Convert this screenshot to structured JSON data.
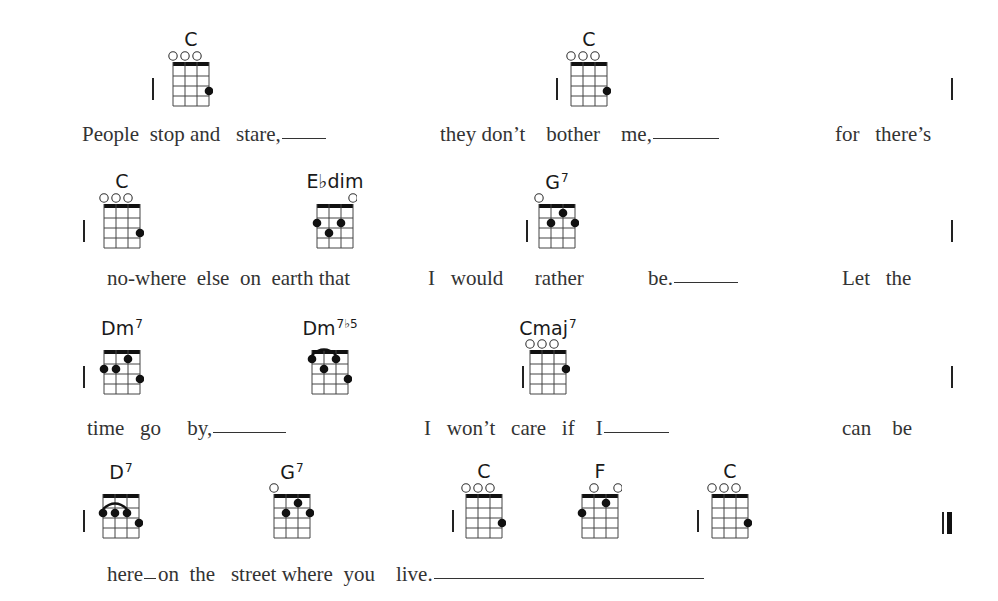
{
  "song": {
    "systems": [
      {
        "chords": [
          {
            "name": "C",
            "sup": "",
            "x": 191,
            "shape": "C"
          },
          {
            "name": "C",
            "sup": "",
            "x": 589,
            "shape": "C"
          }
        ],
        "barlines": [
          152,
          556,
          951
        ],
        "lyrics": [
          {
            "text": "People  stop and   stare,",
            "x": 82,
            "hold": 44
          },
          {
            "text": "they don’t    bother    me,",
            "x": 440,
            "hold": 66
          },
          {
            "text": "for   there’s",
            "x": 835,
            "hold": 0
          }
        ]
      },
      {
        "chords": [
          {
            "name": "C",
            "sup": "",
            "x": 122,
            "shape": "C"
          },
          {
            "name": "E♭dim",
            "sup": "",
            "x": 335,
            "shape": "Ebdim"
          },
          {
            "name": "G",
            "sup": "7",
            "x": 557,
            "shape": "G7"
          }
        ],
        "barlines": [
          83,
          526,
          951
        ],
        "lyrics": [
          {
            "text": "no-where  else  on  earth that",
            "x": 107,
            "hold": 0
          },
          {
            "text": "I   would      rather",
            "x": 428,
            "hold": 0
          },
          {
            "text": "be.",
            "x": 648,
            "hold": 64
          },
          {
            "text": "Let   the",
            "x": 842,
            "hold": 0
          }
        ]
      },
      {
        "chords": [
          {
            "name": "Dm",
            "sup": "7",
            "x": 122,
            "shape": "Dm7"
          },
          {
            "name": "Dm",
            "sup": "7♭5",
            "x": 330,
            "shape": "Dm7b5"
          },
          {
            "name": "Cmaj",
            "sup": "7",
            "x": 548,
            "shape": "Cmaj7"
          }
        ],
        "barlines": [
          83,
          522,
          951
        ],
        "lyrics": [
          {
            "text": "time   go     by,",
            "x": 87,
            "hold": 73
          },
          {
            "text": "I   won’t   care   if    I",
            "x": 424,
            "hold": 65
          },
          {
            "text": "can    be",
            "x": 842,
            "hold": 0
          }
        ]
      },
      {
        "chords": [
          {
            "name": "D",
            "sup": "7",
            "x": 121,
            "shape": "D7"
          },
          {
            "name": "G",
            "sup": "7",
            "x": 292,
            "shape": "G7"
          },
          {
            "name": "C",
            "sup": "",
            "x": 484,
            "shape": "C"
          },
          {
            "name": "F",
            "sup": "",
            "x": 600,
            "shape": "F"
          },
          {
            "name": "C",
            "sup": "",
            "x": 730,
            "shape": "C"
          }
        ],
        "barlines": [
          83,
          452,
          697
        ],
        "final_barline": 942,
        "lyrics": [
          {
            "text": "here",
            "x": 107,
            "hold": 12
          },
          {
            "text": "on  the   street where  you    live.",
            "x": 158,
            "hold": 270
          }
        ]
      }
    ]
  },
  "shapes": {
    "C": {
      "open": [
        0,
        1,
        2
      ],
      "dots": [
        [
          3,
          3
        ]
      ],
      "barre": null
    },
    "Ebdim": {
      "open": [
        3
      ],
      "dots": [
        [
          0,
          2
        ],
        [
          1,
          3
        ],
        [
          2,
          2
        ]
      ],
      "barre": null
    },
    "G7": {
      "open": [
        0
      ],
      "dots": [
        [
          1,
          2
        ],
        [
          2,
          1
        ],
        [
          3,
          2
        ]
      ],
      "barre": null
    },
    "Dm7": {
      "open": [],
      "dots": [
        [
          0,
          2
        ],
        [
          1,
          2
        ],
        [
          2,
          1
        ],
        [
          3,
          3
        ]
      ],
      "barre": null
    },
    "Dm7b5": {
      "open": [],
      "dots": [
        [
          0,
          1
        ],
        [
          1,
          2
        ],
        [
          2,
          1
        ],
        [
          3,
          3
        ]
      ],
      "barre": [
        0,
        2,
        1
      ]
    },
    "Cmaj7": {
      "open": [
        0,
        1,
        2
      ],
      "dots": [
        [
          3,
          2
        ]
      ],
      "barre": null
    },
    "D7": {
      "open": [],
      "dots": [
        [
          0,
          2
        ],
        [
          1,
          2
        ],
        [
          2,
          2
        ],
        [
          3,
          3
        ]
      ],
      "barre": [
        0,
        2,
        2
      ]
    },
    "F": {
      "open": [
        1,
        3
      ],
      "dots": [
        [
          0,
          2
        ],
        [
          2,
          1
        ]
      ],
      "barre": null
    }
  }
}
